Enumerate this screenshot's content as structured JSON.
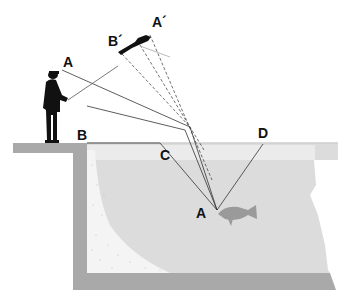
{
  "diagram": {
    "labels": {
      "A_top": "A",
      "B_ledge": "B",
      "A_prime": "A´",
      "B_prime": "B´",
      "C": "C",
      "D": "D",
      "A_fish": "A"
    },
    "elements": {
      "angler": "fisherman-silhouette",
      "apparent_image": "angler-image-raised",
      "fish": "fish-silhouette",
      "water": "water-body",
      "ledge": "bank-ledge",
      "sand": "sandy-bottom"
    },
    "colors": {
      "background": "#ffffff",
      "wall": "#a9a9a9",
      "water": "#dcdcdc",
      "water_surface_band": "#ebebeb",
      "sand": "#f4f4f4",
      "silhouette": "#111111",
      "fish": "#9a9a9a",
      "ray": "#333333"
    }
  }
}
